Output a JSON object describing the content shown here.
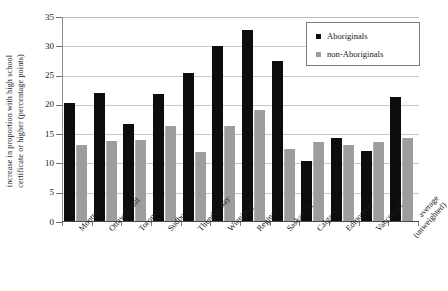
{
  "figure": {
    "top_cut_text": "",
    "ylabel_line1": "increase in proportion with high school",
    "ylabel_line2": "certificate or higher (percentage points)"
  },
  "legend": {
    "position": "top-right",
    "items": [
      {
        "label": "Aboriginals",
        "color": "#0d0d0d",
        "swatch": "square-marker-icon"
      },
      {
        "label": "non-Aboriginals",
        "color": "#9d9d9d",
        "swatch": "square-marker-icon"
      }
    ]
  },
  "axis": {
    "y_ticks": [
      "35",
      "30",
      "25",
      "20",
      "15",
      "10",
      "5",
      "0"
    ],
    "y_min": 0,
    "y_max": 35,
    "y_step": 5
  },
  "chart_data": {
    "type": "bar",
    "title": "",
    "xlabel": "",
    "ylabel": "increase in proportion with high school certificate or higher (percentage points)",
    "ylim": [
      0,
      35
    ],
    "ytick_step": 5,
    "grid": true,
    "legend_position": "upper right",
    "categories": [
      "Montreal",
      "Ottawa-Hull",
      "Toronto",
      "Sudbury",
      "Thunder Bay",
      "Winnipeg",
      "Regina",
      "Saskatoon",
      "Calgary",
      "Edmonton",
      "Vancouver",
      "average (unweighted)"
    ],
    "category_lines": [
      [
        "Montreal"
      ],
      [
        "Ottawa-Hull"
      ],
      [
        "Toronto"
      ],
      [
        "Sudbury"
      ],
      [
        "Thunder Bay"
      ],
      [
        "Winnipeg"
      ],
      [
        "Regina"
      ],
      [
        "Saskatoon"
      ],
      [
        "Calgary"
      ],
      [
        "Edmonton"
      ],
      [
        "Vancouver"
      ],
      [
        "average",
        "(unweighted)"
      ]
    ],
    "series": [
      {
        "name": "Aboriginals",
        "color": "#0d0d0d",
        "values": [
          20.3,
          22.0,
          16.7,
          21.8,
          25.4,
          30.0,
          32.8,
          27.5,
          10.5,
          14.4,
          12.2,
          21.3
        ]
      },
      {
        "name": "non-Aboriginals",
        "color": "#9d9d9d",
        "values": [
          13.1,
          13.8,
          14.0,
          16.4,
          11.9,
          16.4,
          19.2,
          12.4,
          13.6,
          13.2,
          13.7,
          14.3
        ]
      }
    ]
  }
}
